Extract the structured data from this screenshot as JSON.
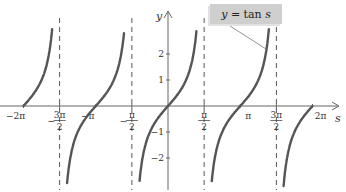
{
  "chart_data": {
    "type": "line",
    "title": "",
    "function_label": "y = tan s",
    "xlabel": "s",
    "ylabel": "y",
    "xlim": [
      -6.6,
      6.6
    ],
    "ylim": [
      -3.0,
      3.0
    ],
    "grid": false,
    "legend_position": "top-center-right callout with leader line",
    "x_ticks": [
      {
        "value": -6.2832,
        "label": "−2π"
      },
      {
        "value": -4.7124,
        "label": "−3π/2"
      },
      {
        "value": -3.1416,
        "label": "−π"
      },
      {
        "value": -1.5708,
        "label": "−π/2"
      },
      {
        "value": 1.5708,
        "label": "π/2"
      },
      {
        "value": 3.1416,
        "label": "π"
      },
      {
        "value": 4.7124,
        "label": "3π/2"
      },
      {
        "value": 6.2832,
        "label": "2π"
      }
    ],
    "y_ticks": [
      {
        "value": 2,
        "label": "2"
      },
      {
        "value": 1,
        "label": "1"
      },
      {
        "value": -1,
        "label": "−1"
      },
      {
        "value": -2,
        "label": "−2"
      }
    ],
    "asymptotes": [
      {
        "x": -4.7124,
        "label": "−3π/2"
      },
      {
        "x": -1.5708,
        "label": "−π/2"
      },
      {
        "x": 1.5708,
        "label": "π/2"
      },
      {
        "x": 4.7124,
        "label": "3π/2"
      }
    ],
    "series": [
      {
        "name": "tan s",
        "branch": "[-2π, -3π/2)",
        "x": [
          -6.2832,
          -5.8905,
          -5.4978,
          -5.1051,
          -4.9
        ],
        "y": [
          0,
          0.414,
          1,
          2.414,
          5.3
        ]
      },
      {
        "name": "tan s",
        "branch": "(-3π/2, -π/2)",
        "x": [
          -4.55,
          -4.3197,
          -3.927,
          -3.1416,
          -2.3562,
          -1.9635,
          -1.75
        ],
        "y": [
          -6.1,
          -2.414,
          -1,
          0,
          1,
          2.414,
          5.5
        ]
      },
      {
        "name": "tan s",
        "branch": "(-π/2, π/2)",
        "x": [
          -1.4,
          -1.1781,
          -0.7854,
          0,
          0.7854,
          1.1781,
          1.4
        ],
        "y": [
          -5.8,
          -2.414,
          -1,
          0,
          1,
          2.414,
          5.8
        ]
      },
      {
        "name": "tan s",
        "branch": "(π/2, 3π/2)",
        "x": [
          1.74,
          1.9635,
          2.3562,
          3.1416,
          3.927,
          4.3197,
          4.55
        ],
        "y": [
          -5.9,
          -2.414,
          -1,
          0,
          1,
          2.414,
          5.9
        ]
      },
      {
        "name": "tan s",
        "branch": "(3π/2, 2π]",
        "x": [
          4.9,
          5.1051,
          5.4978,
          5.8905,
          6.2832
        ],
        "y": [
          -5.3,
          -2.414,
          -1,
          -0.414,
          0
        ]
      }
    ],
    "colors": {
      "curve": "#555555",
      "axis": "#666666",
      "asymptote": "#555555",
      "legend_fill": "#cfcfcf"
    }
  },
  "legend": {
    "prefix": "y",
    "eq": " = tan ",
    "var": "s"
  },
  "axes": {
    "x_name": "s",
    "y_name": "y"
  }
}
